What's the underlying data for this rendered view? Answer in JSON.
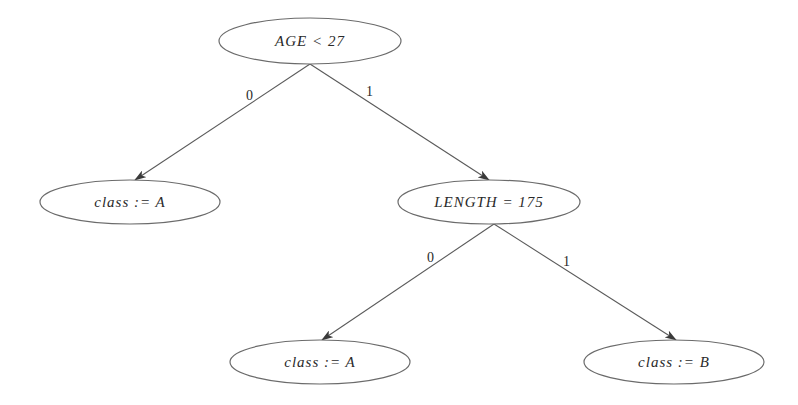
{
  "diagram": {
    "type": "decision-tree",
    "nodes": [
      {
        "id": "root",
        "label": "AGE < 27",
        "cx": 310,
        "cy": 41,
        "rx": 91,
        "ry": 23
      },
      {
        "id": "leftA",
        "label": "class := A",
        "cx": 130,
        "cy": 202,
        "rx": 90,
        "ry": 22
      },
      {
        "id": "length",
        "label": "LENGTH = 175",
        "cx": 489,
        "cy": 202,
        "rx": 91,
        "ry": 22
      },
      {
        "id": "llA",
        "label": "class := A",
        "cx": 320,
        "cy": 362,
        "rx": 90,
        "ry": 22
      },
      {
        "id": "lrB",
        "label": "class := B",
        "cx": 674,
        "cy": 362,
        "rx": 90,
        "ry": 22
      }
    ],
    "edges": [
      {
        "from": "root",
        "to": "leftA",
        "label": "0",
        "x1": 310,
        "y1": 64,
        "x2": 135,
        "y2": 180,
        "lx": 246,
        "ly": 100
      },
      {
        "from": "root",
        "to": "length",
        "label": "1",
        "x1": 310,
        "y1": 64,
        "x2": 489,
        "y2": 180,
        "lx": 366,
        "ly": 96
      },
      {
        "from": "length",
        "to": "llA",
        "label": "0",
        "x1": 494,
        "y1": 224,
        "x2": 322,
        "y2": 340,
        "lx": 427,
        "ly": 262
      },
      {
        "from": "length",
        "to": "lrB",
        "label": "1",
        "x1": 494,
        "y1": 224,
        "x2": 676,
        "y2": 340,
        "lx": 563,
        "ly": 266
      }
    ]
  }
}
